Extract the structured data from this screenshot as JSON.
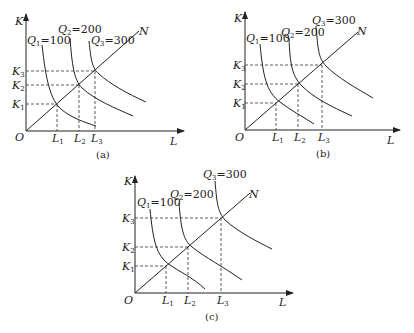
{
  "figure": {
    "panels": [
      {
        "caption": "(a)",
        "axes": {
          "y_label": "K",
          "x_label": "L",
          "origin_label": "O"
        },
        "ray_label": "N",
        "isoquants": [
          {
            "name": "Q",
            "sub": "1",
            "value": "=100"
          },
          {
            "name": "Q",
            "sub": "2",
            "value": "=200"
          },
          {
            "name": "Q",
            "sub": "3",
            "value": "=300"
          }
        ],
        "k_ticks": [
          {
            "name": "K",
            "sub": "1"
          },
          {
            "name": "K",
            "sub": "2"
          },
          {
            "name": "K",
            "sub": "3"
          }
        ],
        "l_ticks": [
          {
            "name": "L",
            "sub": "1"
          },
          {
            "name": "L",
            "sub": "2"
          },
          {
            "name": "L",
            "sub": "3"
          }
        ],
        "note": "Increasing returns to scale: isoquants get closer together"
      },
      {
        "caption": "(b)",
        "axes": {
          "y_label": "K",
          "x_label": "L",
          "origin_label": "O"
        },
        "ray_label": "N",
        "isoquants": [
          {
            "name": "Q",
            "sub": "1",
            "value": "=100"
          },
          {
            "name": "Q",
            "sub": "2",
            "value": "=200"
          },
          {
            "name": "Q",
            "sub": "3",
            "value": "=300"
          }
        ],
        "k_ticks": [
          {
            "name": "K",
            "sub": "1"
          },
          {
            "name": "K",
            "sub": "2"
          },
          {
            "name": "K",
            "sub": "3"
          }
        ],
        "l_ticks": [
          {
            "name": "L",
            "sub": "1"
          },
          {
            "name": "L",
            "sub": "2"
          },
          {
            "name": "L",
            "sub": "3"
          }
        ],
        "note": "Constant returns to scale: isoquants equally spaced"
      },
      {
        "caption": "(c)",
        "axes": {
          "y_label": "K",
          "x_label": "L",
          "origin_label": "O"
        },
        "ray_label": "N",
        "isoquants": [
          {
            "name": "Q",
            "sub": "1",
            "value": "=100"
          },
          {
            "name": "Q",
            "sub": "2",
            "value": "=200"
          },
          {
            "name": "Q",
            "sub": "3",
            "value": "=300"
          }
        ],
        "k_ticks": [
          {
            "name": "K",
            "sub": "1"
          },
          {
            "name": "K",
            "sub": "2"
          },
          {
            "name": "K",
            "sub": "3"
          }
        ],
        "l_ticks": [
          {
            "name": "L",
            "sub": "1"
          },
          {
            "name": "L",
            "sub": "2"
          },
          {
            "name": "L",
            "sub": "3"
          }
        ],
        "note": "Decreasing returns to scale: isoquants farther apart"
      }
    ]
  }
}
